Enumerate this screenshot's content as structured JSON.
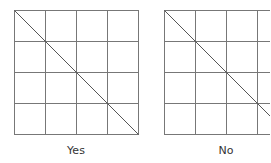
{
  "diagrams": [
    {
      "label": "Yes",
      "x": 14,
      "y": 10,
      "cell": 31,
      "rows": 4,
      "cols": 4,
      "diagonal": "top-left-to-bottom-right"
    },
    {
      "label": "No",
      "x": 164,
      "y": 10,
      "cell": 31,
      "rows": 4,
      "cols": 4,
      "diagonal": "top-left-to-bottom-right"
    }
  ],
  "colors": {
    "grid": "#777777",
    "diagonal": "#555555"
  }
}
